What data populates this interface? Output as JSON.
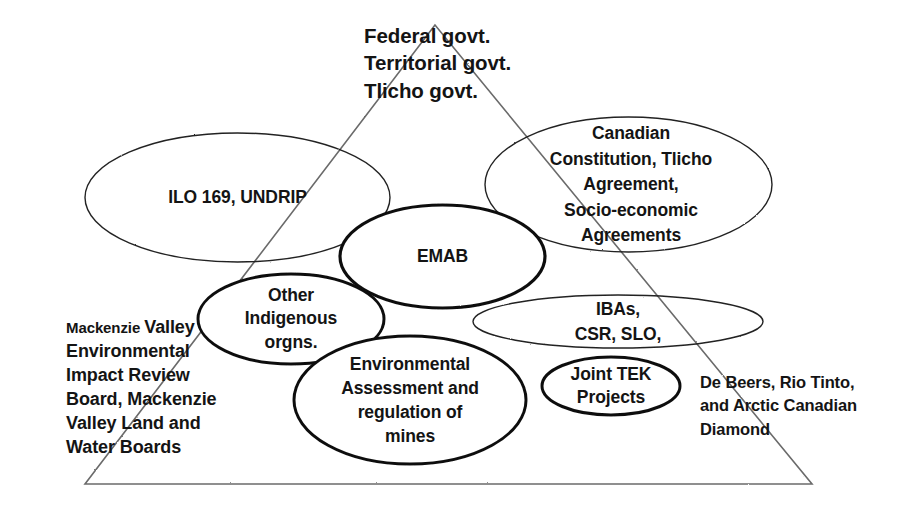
{
  "diagram": {
    "background_color": "#ffffff",
    "text_color": "#141414",
    "line_color": "#5a5a5a",
    "ellipse_stroke_color": "#1a1a1a",
    "triangle": {
      "label": "governance-triangle",
      "apex": [
        435,
        25
      ],
      "bottom_left": [
        85,
        484
      ],
      "bottom_right": [
        812,
        484
      ],
      "stroke_color": "#6b6b6b",
      "stroke_width": 1.6
    },
    "apex_labels": {
      "name": "apex-government-levels",
      "lines": "Federal govt.\nTerritorial govt.\nTlicho govt.",
      "line_items": [
        "Federal govt.",
        "Territorial govt.",
        "Tlicho govt."
      ]
    },
    "ellipses": [
      {
        "id": "ilo-undrip",
        "label": "ILO 169, UNDRIP",
        "cx": 237.5,
        "cy": 197.5,
        "rx": 152.5,
        "ry": 64.5,
        "stroke_width": 1.4
      },
      {
        "id": "canadian-constitution",
        "label": "Canadian\nConstitution, Tlicho\nAgreement,\nSocio-economic\nAgreements",
        "cx": 628.5,
        "cy": 184.5,
        "rx": 143.5,
        "ry": 67.5,
        "stroke_width": 1.4
      },
      {
        "id": "emab",
        "label": "EMAB",
        "cx": 442.5,
        "cy": 256.5,
        "rx": 102.5,
        "ry": 51.5,
        "stroke_width": 3.2
      },
      {
        "id": "other-indigenous-orgns",
        "label": "Other\nIndigenous\norgns.",
        "cx": 291,
        "cy": 319,
        "rx": 93,
        "ry": 45,
        "stroke_width": 3.0
      },
      {
        "id": "ibas-csr-slo",
        "label": "IBAs,\nCSR, SLO,",
        "cx": 618,
        "cy": 321.5,
        "rx": 145,
        "ry": 26.5,
        "stroke_width": 1.4
      },
      {
        "id": "environmental-assessment",
        "label": "Environmental\nAssessment and\nregulation of\nmines",
        "cx": 410,
        "cy": 400,
        "rx": 116,
        "ry": 64,
        "stroke_width": 3.0
      },
      {
        "id": "joint-tek-projects",
        "label": "Joint TEK\nProjects",
        "cx": 611,
        "cy": 386,
        "rx": 69,
        "ry": 29,
        "stroke_width": 3.0
      }
    ],
    "free_text": {
      "mvirb": {
        "name": "mackenzie-valley-boards-text",
        "lead_word": "Mackenzie ",
        "rest": "Valley\nEnvironmental\nImpact Review\nBoard, Mackenzie\nValley Land and\nWater Boards",
        "full": "Mackenzie Valley Environmental Impact Review Board, Mackenzie Valley Land and Water Boards"
      },
      "companies": {
        "name": "mining-companies-text",
        "lines": "De Beers, Rio Tinto,\nand Arctic Canadian\nDiamond",
        "full": "De Beers, Rio Tinto, and Arctic Canadian Diamond"
      }
    }
  }
}
